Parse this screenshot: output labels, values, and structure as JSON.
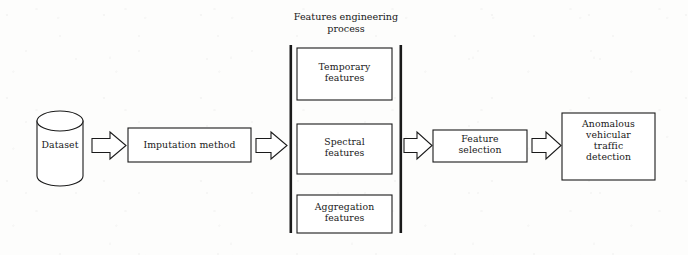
{
  "diagram": {
    "title": "Features engineering process",
    "title_lines": [
      "Features engineering",
      "process"
    ],
    "background_color": "#fdfdfc",
    "stroke_color": "#1a1a1a",
    "nodes": {
      "dataset": {
        "label": "Dataset",
        "shape": "cylinder"
      },
      "imputation": {
        "label": "Imputation method",
        "shape": "rectangle"
      },
      "temporary_features": {
        "label": "Temporary features",
        "lines": [
          "Temporary",
          "features"
        ],
        "shape": "rectangle"
      },
      "spectral_features": {
        "label": "Spectral features",
        "lines": [
          "Spectral",
          "features"
        ],
        "shape": "rectangle"
      },
      "aggregation_features": {
        "label": "Aggregation features",
        "lines": [
          "Aggregation",
          "features"
        ],
        "shape": "rectangle"
      },
      "feature_selection": {
        "label": "Feature selection",
        "lines": [
          "Feature",
          "selection"
        ],
        "shape": "rectangle"
      },
      "detection": {
        "label": "Anomalous vehicular traffic detection",
        "lines": [
          "Anomalous",
          "vehicular",
          "traffic",
          "detection"
        ],
        "shape": "rectangle"
      }
    },
    "group": {
      "name": "features-engineering-group",
      "bracket_left": "|",
      "bracket_right": "|"
    },
    "arrows": [
      {
        "name": "arrow-dataset-to-imputation",
        "from": "dataset",
        "to": "imputation",
        "direction": "right",
        "style": "block-outline"
      },
      {
        "name": "arrow-imputation-to-features",
        "from": "imputation",
        "to": "features-engineering-group",
        "direction": "right",
        "style": "block-outline"
      },
      {
        "name": "arrow-features-to-selection",
        "from": "features-engineering-group",
        "to": "feature_selection",
        "direction": "right",
        "style": "block-outline"
      },
      {
        "name": "arrow-selection-to-detection",
        "from": "feature_selection",
        "to": "detection",
        "direction": "right",
        "style": "block-outline"
      }
    ]
  }
}
